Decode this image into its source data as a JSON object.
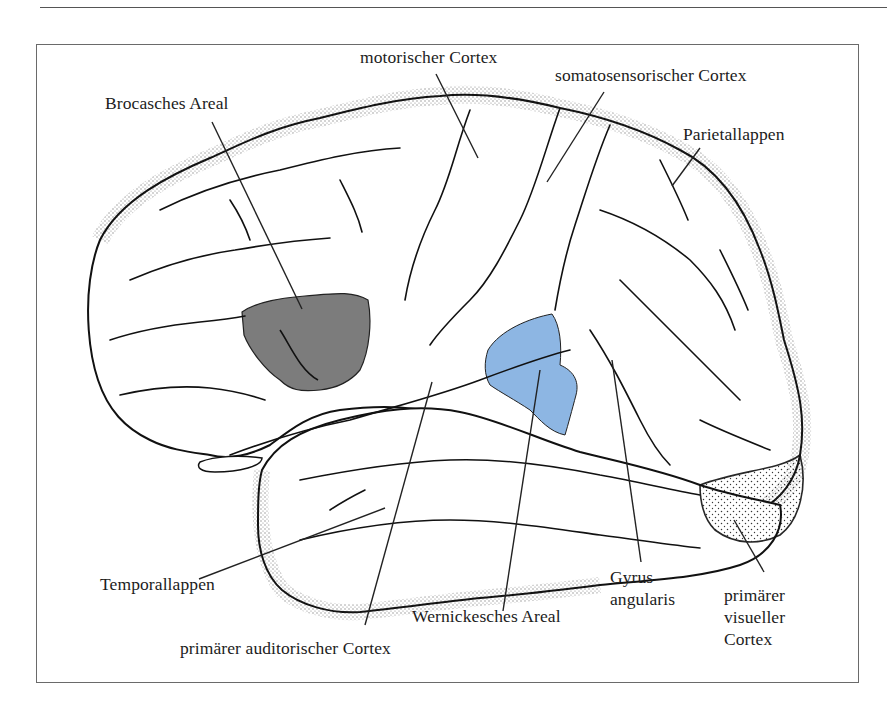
{
  "figure": {
    "type": "lateral view of the left cerebral hemisphere",
    "colors": {
      "broca_fill": "#7c7c7c",
      "wernicke_fill": "#8db6e3",
      "outline": "#111111",
      "frame": "#6a6a6a"
    },
    "labels": {
      "motor_cortex": "motorischer Cortex",
      "somatosensory_cortex": "somatosensorischer Cortex",
      "broca": "Brocasches Areal",
      "parietal_lobe": "Parietallappen",
      "temporal_lobe": "Temporallappen",
      "wernicke": "Wernickesches Areal",
      "angular_gyrus": "Gyrus\nangularis",
      "primary_auditory_cortex": "primärer auditorischer Cortex",
      "primary_visual_cortex": "primärer\nvisueller\nCortex"
    }
  }
}
